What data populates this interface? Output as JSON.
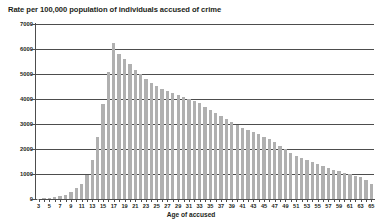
{
  "chart_data": {
    "type": "bar",
    "title": "Rate per 100,000 population of individuals accused of crime",
    "xlabel": "Age of accused",
    "ylabel": "",
    "ylim": [
      0,
      7000
    ],
    "ytick_step": 1000,
    "yticks": [
      0,
      1000,
      2000,
      3000,
      4000,
      5000,
      6000,
      7000
    ],
    "ytick_labels": [
      "0",
      "1000",
      "2000",
      "3000",
      "4000",
      "5000",
      "6000",
      "7000"
    ],
    "grid": true,
    "grid_axis": "y",
    "legend": false,
    "bar_color": "#b0b0b0",
    "xlim": [
      3,
      65
    ],
    "xtick_step": 1,
    "xtick_label_step": 2,
    "categories": [
      3,
      4,
      5,
      6,
      7,
      8,
      9,
      10,
      11,
      12,
      13,
      14,
      15,
      16,
      17,
      18,
      19,
      20,
      21,
      22,
      23,
      24,
      25,
      26,
      27,
      28,
      29,
      30,
      31,
      32,
      33,
      34,
      35,
      36,
      37,
      38,
      39,
      40,
      41,
      42,
      43,
      44,
      45,
      46,
      47,
      48,
      49,
      50,
      51,
      52,
      53,
      54,
      55,
      56,
      57,
      58,
      59,
      60,
      61,
      62,
      63,
      64,
      65
    ],
    "values": [
      20,
      30,
      50,
      70,
      110,
      180,
      300,
      430,
      620,
      980,
      1560,
      2480,
      3800,
      5080,
      6250,
      5800,
      5620,
      5400,
      5160,
      5000,
      4800,
      4640,
      4520,
      4400,
      4320,
      4240,
      4160,
      4080,
      4000,
      3920,
      3840,
      3700,
      3560,
      3440,
      3320,
      3200,
      3080,
      2960,
      2840,
      2760,
      2680,
      2600,
      2500,
      2400,
      2280,
      2140,
      2000,
      1860,
      1740,
      1660,
      1580,
      1500,
      1420,
      1340,
      1260,
      1180,
      1120,
      1060,
      1000,
      940,
      880,
      760,
      620
    ]
  }
}
